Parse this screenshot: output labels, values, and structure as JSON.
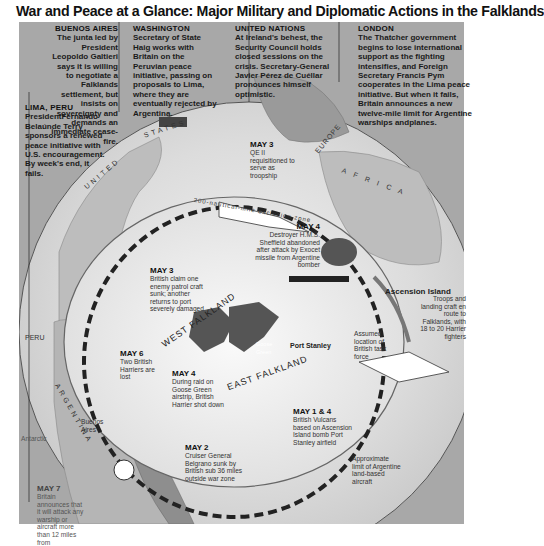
{
  "title": "War and Peace at a Glance: Major Military and Diplomatic Actions  in the Falklands",
  "diplomatic_boxes": [
    {
      "id": "buenos-aires",
      "heading": "BUENOS  AIRES",
      "text": "The junta led by President Leopoldo Galtieri says it is willing to negotiate a Falklands settlement, but insists on sovereignty and demands an immediate cease-fire."
    },
    {
      "id": "washington",
      "heading": "WASHINGTON",
      "text": "Secretary of State Haig works with Britain on the Peruvian peace initiative, passing on proposals to Lima, where they are eventually rejected by Argentina."
    },
    {
      "id": "united-nations",
      "heading": "UNITED NATIONS",
      "text": "At Ireland's behest, the Security Council holds closed sessions on the crisis. Secretary-General Javier Pérez de Cuéllar pronounces himself optimistic."
    },
    {
      "id": "london",
      "heading": "LONDON",
      "text": "The Thatcher government begins to lose international support as the fighting intensifies, and Foreign Secretary Francis Pym cooperates in the Lima peace initiative. But when it fails, Britain announces a new twelve-mile limit for Argentine warships andplanes."
    },
    {
      "id": "lima",
      "heading": "LIMA, PERU",
      "text": "PresidentFernando Belaúnde Terry sponsors a renewed peace initiative with U.S. encouragement. By week's end, it fails."
    }
  ],
  "events": [
    {
      "date": "MAY 3",
      "text": "QE II requisitioned to serve as troopship"
    },
    {
      "date": "MAY 4",
      "text": "Destroyer H.M.S. Sheffield abandoned after attack by Exocet missile from Argentine bomber"
    },
    {
      "date": "MAY 3",
      "text": "British claim one enemy patrol craft sunk; another returns to port severely damaged"
    },
    {
      "date": "MAY 6",
      "text": "Two British Harriers are lost"
    },
    {
      "date": "MAY 4",
      "text": "During raid on Goose Green airstrip, British Harrier shot down"
    },
    {
      "date": "MAY 1 & 4",
      "text": "British Vulcans based on Ascension Island bomb Port Stanley airfield"
    },
    {
      "date": "MAY 2",
      "text": "Cruiser General Belgrano sunk by British sub 36 miles outside war zone"
    },
    {
      "date": "MAY 7",
      "text": "Britain announces that it will attack any warship or aircraft more than 12 miles from"
    }
  ],
  "map_labels": {
    "united_states_1": "UNITED",
    "united_states_2": "STATES",
    "europe": "EUROPE",
    "africa": "A   F   R   I   C   A",
    "peru": "PERU",
    "argentina": "ARGENTINA",
    "west_falkland": "WEST FALKLAND",
    "east_falkland": "EAST FALKLAND",
    "exclusion_zone": "200-nautical-mile exclusion zone",
    "ascension": "Ascension Island",
    "port_stanley": "Port Stanley",
    "goose_green": "Goose Green",
    "buenos_aires": "Buenos Aires",
    "antarctic": "Antarctic",
    "task_force": "Assumed location of British task force",
    "troops": "Troops and landing craft en route to Falklands, with 18 to 20 Harrier fighters",
    "air_limit": "Approximate limit of Argentine land-based aircraft"
  }
}
